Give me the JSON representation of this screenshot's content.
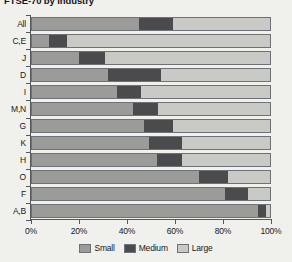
{
  "chart_data": {
    "type": "bar",
    "orientation": "horizontal",
    "stacked": true,
    "stacked_normalized": true,
    "title": "FTSE-70 by industry",
    "xlabel": "",
    "ylabel": "",
    "xlim": [
      0,
      100
    ],
    "xtick_labels": [
      "0%",
      "20%",
      "40%",
      "60%",
      "80%",
      "100%"
    ],
    "xtick_values": [
      0,
      20,
      40,
      60,
      80,
      100
    ],
    "grid": false,
    "legend_position": "bottom",
    "categories": [
      "All",
      "C,E",
      "J",
      "D",
      "I",
      "M,N",
      "G",
      "K",
      "H",
      "O",
      "F",
      "A,B"
    ],
    "series": [
      {
        "name": "Small",
        "color": "#9b9b99",
        "values": [
          45,
          7.5,
          20,
          32,
          36,
          42.5,
          47,
          49,
          52.5,
          70,
          81,
          94.5
        ]
      },
      {
        "name": "Medium",
        "color": "#4b4b4d",
        "values": [
          14,
          7.5,
          11,
          22,
          10,
          10.5,
          12,
          14,
          10.5,
          12,
          9.5,
          3.5
        ]
      },
      {
        "name": "Large",
        "color": "#c9c9c6",
        "values": [
          41,
          85,
          69,
          46,
          54,
          47,
          41,
          37,
          37,
          18,
          9.5,
          2
        ]
      }
    ]
  },
  "legend": {
    "items": [
      {
        "label": "Small",
        "color": "#9b9b99"
      },
      {
        "label": "Medium",
        "color": "#4b4b4d"
      },
      {
        "label": "Large",
        "color": "#c9c9c6"
      }
    ]
  }
}
